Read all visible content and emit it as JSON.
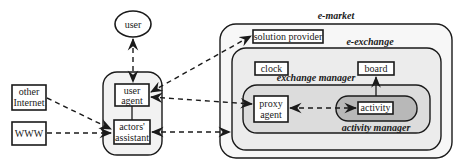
{
  "diagram": {
    "colors": {
      "background": "#ffffff",
      "outline": "#1a1a1a",
      "e_market_fill": "#f7f7f7",
      "e_exchange_fill": "#ececec",
      "exchange_manager_fill": "#dcdcdc",
      "activity_manager_fill": "#b8b8b8",
      "actor_container_fill": "#f2f2f2"
    },
    "nodes": {
      "user": "user",
      "other_internet": [
        "other",
        "Internet"
      ],
      "www": "WWW",
      "user_agent": [
        "user",
        "agent"
      ],
      "actors_assistant": [
        "actors'",
        "assistant"
      ],
      "solution_provider": "solution provider",
      "clock": "clock",
      "board": "board",
      "proxy_agent": [
        "proxy",
        "agent"
      ],
      "activity": "activity"
    },
    "containers": {
      "e_market": "e-market",
      "e_exchange": "e-exchange",
      "exchange_manager": "exchange manager",
      "activity_manager": "activity manager"
    },
    "edges": [
      {
        "from": "user",
        "to": "user_agent",
        "style": "dashed",
        "arrows": "both"
      },
      {
        "from": "other_internet",
        "to": "actors_assistant",
        "style": "dashed",
        "arrows": "end"
      },
      {
        "from": "www",
        "to": "actors_assistant",
        "style": "dashed",
        "arrows": "end"
      },
      {
        "from": "user_agent",
        "to": "solution_provider",
        "style": "dashed",
        "arrows": "both"
      },
      {
        "from": "user_agent",
        "to": "proxy_agent",
        "style": "dashed",
        "arrows": "both"
      },
      {
        "from": "actors_assistant",
        "to": "e_exchange",
        "style": "dashed",
        "arrows": "both"
      },
      {
        "from": "proxy_agent",
        "to": "activity",
        "style": "dashed",
        "arrows": "both"
      },
      {
        "from": "activity_manager",
        "to": "board",
        "style": "solid",
        "arrows": "end"
      },
      {
        "from": "user_agent",
        "to": "actors_assistant",
        "style": "solid",
        "arrows": "none"
      }
    ]
  }
}
